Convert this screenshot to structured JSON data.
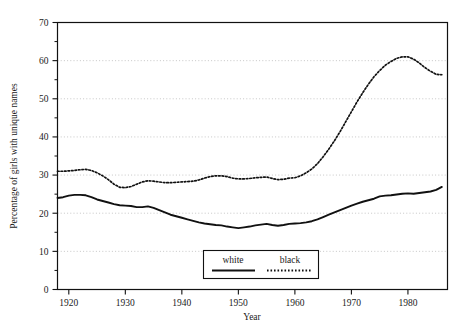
{
  "chart_data": {
    "type": "line",
    "title": "",
    "xlabel": "Year",
    "ylabel": "Percentage of girls with unique names",
    "xlim": [
      1918,
      1987
    ],
    "ylim": [
      0,
      70
    ],
    "xticks": [
      1920,
      1930,
      1940,
      1950,
      1960,
      1970,
      1980
    ],
    "yticks": [
      0,
      10,
      20,
      30,
      40,
      50,
      60,
      70
    ],
    "yminorticks": [
      5,
      15,
      25,
      35,
      45,
      55,
      65
    ],
    "grid": "horizontal-dotted-at-major-y",
    "legend_position": "bottom-center-inside",
    "legend": [
      "white",
      "black"
    ],
    "x": [
      1918,
      1919,
      1920,
      1921,
      1922,
      1923,
      1924,
      1925,
      1926,
      1927,
      1928,
      1929,
      1930,
      1931,
      1932,
      1933,
      1934,
      1935,
      1936,
      1937,
      1938,
      1939,
      1940,
      1941,
      1942,
      1943,
      1944,
      1945,
      1946,
      1947,
      1948,
      1949,
      1950,
      1951,
      1952,
      1953,
      1954,
      1955,
      1956,
      1957,
      1958,
      1959,
      1960,
      1961,
      1962,
      1963,
      1964,
      1965,
      1966,
      1967,
      1968,
      1969,
      1970,
      1971,
      1972,
      1973,
      1974,
      1975,
      1976,
      1977,
      1978,
      1979,
      1980,
      1981,
      1982,
      1983,
      1984,
      1985,
      1986
    ],
    "series": [
      {
        "name": "white",
        "style": "solid",
        "color": "#111111",
        "values": [
          24.0,
          24.2,
          24.6,
          24.8,
          24.8,
          24.7,
          24.2,
          23.6,
          23.2,
          22.8,
          22.4,
          22.1,
          22.0,
          21.9,
          21.6,
          21.6,
          21.8,
          21.4,
          20.8,
          20.2,
          19.6,
          19.2,
          18.8,
          18.4,
          18.0,
          17.6,
          17.3,
          17.1,
          16.9,
          16.8,
          16.5,
          16.3,
          16.1,
          16.3,
          16.5,
          16.8,
          17.0,
          17.2,
          16.9,
          16.7,
          16.9,
          17.2,
          17.3,
          17.4,
          17.6,
          17.9,
          18.4,
          19.0,
          19.6,
          20.2,
          20.8,
          21.4,
          22.0,
          22.5,
          23.0,
          23.4,
          23.8,
          24.4,
          24.6,
          24.7,
          24.9,
          25.1,
          25.2,
          25.1,
          25.3,
          25.5,
          25.7,
          26.1,
          26.9
        ]
      },
      {
        "name": "black",
        "style": "dotted",
        "color": "#111111",
        "values": [
          31.0,
          31.0,
          31.1,
          31.2,
          31.4,
          31.5,
          31.2,
          30.6,
          29.8,
          28.8,
          27.6,
          26.8,
          26.7,
          27.0,
          27.6,
          28.2,
          28.5,
          28.4,
          28.2,
          28.0,
          28.0,
          28.1,
          28.2,
          28.3,
          28.4,
          28.7,
          29.2,
          29.6,
          29.8,
          29.8,
          29.6,
          29.2,
          29.0,
          29.0,
          29.1,
          29.3,
          29.4,
          29.5,
          29.1,
          28.8,
          28.9,
          29.2,
          29.3,
          29.8,
          30.6,
          31.6,
          33.0,
          34.8,
          36.8,
          39.0,
          41.4,
          44.0,
          46.6,
          49.2,
          51.6,
          53.8,
          55.8,
          57.4,
          58.8,
          59.8,
          60.6,
          61.0,
          61.0,
          60.4,
          59.4,
          58.2,
          57.2,
          56.4,
          56.3
        ]
      }
    ]
  },
  "axis": {
    "y_title": "Percentage of girls with unique names",
    "x_title": "Year",
    "ytick_labels": [
      "0",
      "10",
      "20",
      "30",
      "40",
      "50",
      "60",
      "70"
    ],
    "xtick_labels": [
      "1920",
      "1930",
      "1940",
      "1950",
      "1960",
      "1970",
      "1980"
    ]
  },
  "legend": {
    "white_label": "white",
    "black_label": "black"
  }
}
